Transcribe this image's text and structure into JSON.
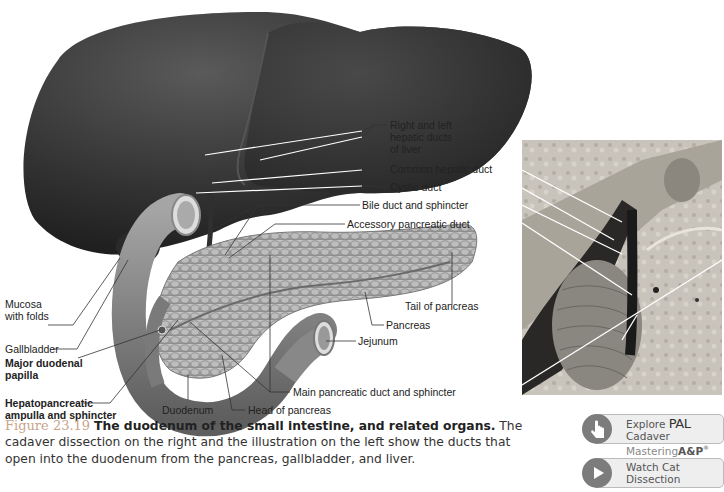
{
  "figure": {
    "number": "Figure 23.19",
    "title": "The duodenum of the small intestine, and related organs.",
    "caption_lines": [
      "cadaver dissection on the right and the illustration on the left show the ducts that",
      "open into the duodenum from the pancreas, gallbladder, and liver."
    ],
    "caption_first_line_tail": "The"
  },
  "labels": {
    "right_left_hepatic": [
      "Right and left",
      "hepatic ducts",
      "of liver"
    ],
    "common_hepatic_duct": "Common hepatic duct",
    "cystic_duct": "Cystic duct",
    "bile_duct": "Bile duct and sphincter",
    "accessory_pancreatic_duct": "Accessory pancreatic duct",
    "mucosa": [
      "Mucosa",
      "with folds"
    ],
    "gallbladder": "Gallbladder",
    "major_duodenal_papilla": [
      "Major duodenal",
      "papilla"
    ],
    "hepatopancreatic": [
      "Hepatopancreatic",
      "ampulla and sphincter"
    ],
    "duodenum": "Duodenum",
    "head_of_pancreas": "Head of pancreas",
    "main_pancreatic_duct": "Main pancreatic duct and sphincter",
    "jejunum": "Jejunum",
    "pancreas": "Pancreas",
    "tail_of_pancreas": "Tail of pancreas"
  },
  "buttons": {
    "explore_pal": {
      "prefix": "Explore",
      "pal": "PAL",
      "suffix": "Cadaver",
      "line2_a": "Mastering",
      "line2_b": "A&P",
      "reg": "®",
      "icon": "hand-pointer-icon"
    },
    "watch_cat": {
      "label": "Watch Cat Dissection",
      "icon": "play-icon"
    }
  },
  "colors": {
    "figure_number": "#c9a48b",
    "liver": "#3a3a3a",
    "pancreas": "#a9a9a9",
    "button_bg": "#eeeeee",
    "button_icon": "#7c7c7c"
  }
}
